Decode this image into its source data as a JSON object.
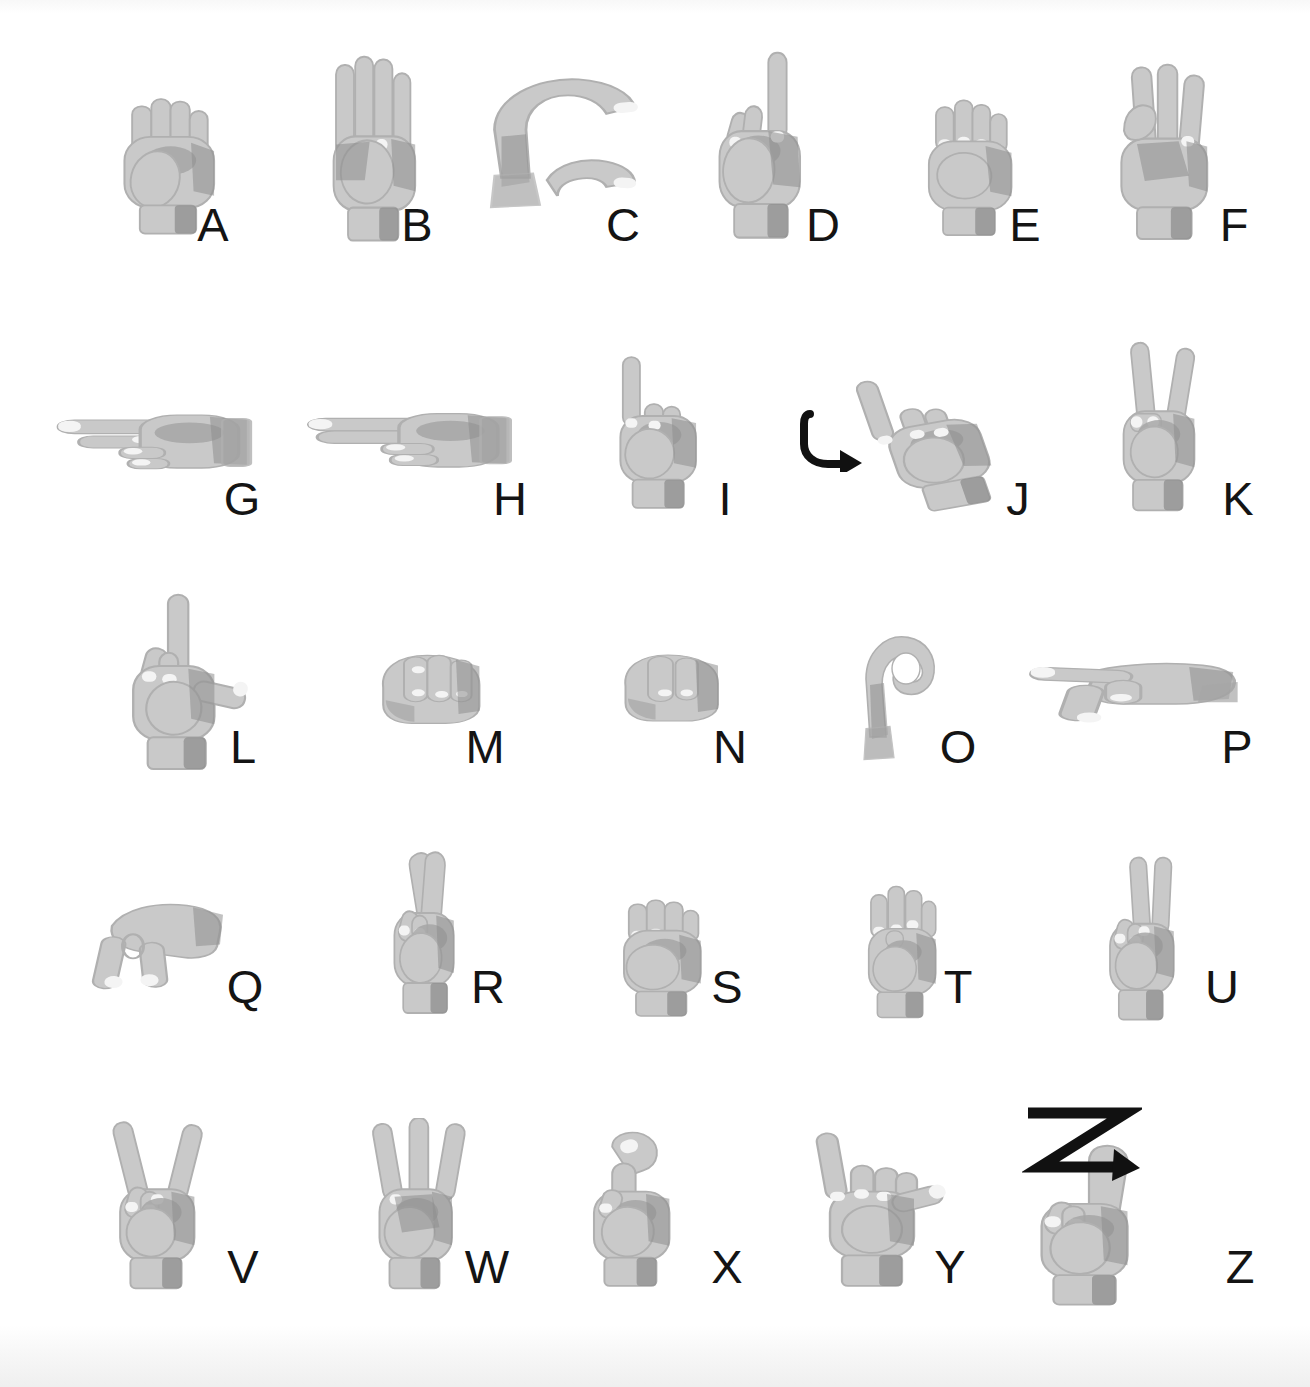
{
  "chart": {
    "width": 1310,
    "height": 1387,
    "background_color": "#ffffff",
    "letter_color": "#141414",
    "hand_fill": "#c9c9c9",
    "hand_shade": "#a6a6a6",
    "hand_deep_shade": "#8e8e8e",
    "hand_outline": "#b0b0b0",
    "nail_color": "#f4f4f4",
    "arrow_color": "#111111",
    "letter_font_size": 47,
    "rows": 5,
    "total_signs": 26
  },
  "signs": [
    {
      "letter": "A",
      "shape": "closed-fist-thumb-side",
      "row": 1,
      "col": 1,
      "hand_x": 104,
      "hand_y": 78,
      "hand_w": 128,
      "hand_h": 165,
      "letter_x": 213,
      "letter_y": 248,
      "motion": "none"
    },
    {
      "letter": "B",
      "shape": "flat-hand-thumb-across-palm",
      "row": 1,
      "col": 2,
      "hand_x": 312,
      "hand_y": 54,
      "hand_w": 120,
      "hand_h": 192,
      "letter_x": 417,
      "letter_y": 248,
      "motion": "none"
    },
    {
      "letter": "C",
      "shape": "curved-c-shape",
      "row": 1,
      "col": 3,
      "hand_x": 470,
      "hand_y": 68,
      "hand_w": 175,
      "hand_h": 160,
      "letter_x": 623,
      "letter_y": 248,
      "motion": "none"
    },
    {
      "letter": "D",
      "shape": "index-up-others-touch-thumb",
      "row": 1,
      "col": 4,
      "hand_x": 700,
      "hand_y": 50,
      "hand_w": 122,
      "hand_h": 196,
      "letter_x": 823,
      "letter_y": 248,
      "motion": "none"
    },
    {
      "letter": "E",
      "shape": "fingers-curled-onto-thumb",
      "row": 1,
      "col": 5,
      "hand_x": 910,
      "hand_y": 82,
      "hand_w": 118,
      "hand_h": 160,
      "letter_x": 1025,
      "letter_y": 248,
      "motion": "none"
    },
    {
      "letter": "F",
      "shape": "index-thumb-circle-three-up",
      "row": 1,
      "col": 6,
      "hand_x": 1098,
      "hand_y": 62,
      "hand_w": 130,
      "hand_h": 185,
      "letter_x": 1234,
      "letter_y": 248,
      "motion": "none"
    },
    {
      "letter": "G",
      "shape": "index-thumb-pointing-sideways",
      "row": 2,
      "col": 1,
      "hand_x": 50,
      "hand_y": 388,
      "hand_w": 205,
      "hand_h": 112,
      "letter_x": 242,
      "letter_y": 522,
      "motion": "none"
    },
    {
      "letter": "H",
      "shape": "two-fingers-pointing-sideways",
      "row": 2,
      "col": 2,
      "hand_x": 300,
      "hand_y": 390,
      "hand_w": 215,
      "hand_h": 110,
      "letter_x": 510,
      "letter_y": 522,
      "motion": "none"
    },
    {
      "letter": "I",
      "shape": "pinky-up-fist",
      "row": 2,
      "col": 3,
      "hand_x": 596,
      "hand_y": 350,
      "hand_w": 122,
      "hand_h": 165,
      "letter_x": 725,
      "letter_y": 522,
      "motion": "none"
    },
    {
      "letter": "J",
      "shape": "pinky-up-with-j-trace",
      "row": 2,
      "col": 4,
      "hand_x": 856,
      "hand_y": 368,
      "hand_w": 150,
      "hand_h": 150,
      "letter_x": 1018,
      "letter_y": 522,
      "motion": "hook-arrow",
      "arrow_x": 800,
      "arrow_y": 410,
      "arrow_w": 70,
      "arrow_h": 62
    },
    {
      "letter": "K",
      "shape": "index-middle-up-thumb-between",
      "row": 2,
      "col": 5,
      "hand_x": 1100,
      "hand_y": 340,
      "hand_w": 118,
      "hand_h": 178,
      "letter_x": 1238,
      "letter_y": 522,
      "motion": "none"
    },
    {
      "letter": "L",
      "shape": "index-up-thumb-out-l-shape",
      "row": 3,
      "col": 1,
      "hand_x": 110,
      "hand_y": 592,
      "hand_w": 145,
      "hand_h": 185,
      "letter_x": 243,
      "letter_y": 770,
      "motion": "none"
    },
    {
      "letter": "M",
      "shape": "thumb-under-three-fingers",
      "row": 3,
      "col": 2,
      "hand_x": 365,
      "hand_y": 640,
      "hand_w": 130,
      "hand_h": 108,
      "letter_x": 485,
      "letter_y": 770,
      "motion": "none"
    },
    {
      "letter": "N",
      "shape": "thumb-under-two-fingers",
      "row": 3,
      "col": 3,
      "hand_x": 608,
      "hand_y": 640,
      "hand_w": 125,
      "hand_h": 105,
      "letter_x": 730,
      "letter_y": 770,
      "motion": "none"
    },
    {
      "letter": "O",
      "shape": "fingers-thumb-circle",
      "row": 3,
      "col": 4,
      "hand_x": 848,
      "hand_y": 625,
      "hand_w": 100,
      "hand_h": 145,
      "letter_x": 958,
      "letter_y": 770,
      "motion": "none"
    },
    {
      "letter": "P",
      "shape": "k-shape-pointing-down",
      "row": 3,
      "col": 5,
      "hand_x": 1022,
      "hand_y": 645,
      "hand_w": 220,
      "hand_h": 118,
      "letter_x": 1237,
      "letter_y": 770,
      "motion": "none"
    },
    {
      "letter": "Q",
      "shape": "g-shape-pointing-down",
      "row": 4,
      "col": 1,
      "hand_x": 88,
      "hand_y": 885,
      "hand_w": 150,
      "hand_h": 130,
      "letter_x": 245,
      "letter_y": 1010,
      "motion": "none"
    },
    {
      "letter": "R",
      "shape": "crossed-index-middle",
      "row": 4,
      "col": 2,
      "hand_x": 368,
      "hand_y": 848,
      "hand_w": 110,
      "hand_h": 175,
      "letter_x": 488,
      "letter_y": 1010,
      "motion": "none"
    },
    {
      "letter": "S",
      "shape": "fist-thumb-across-front",
      "row": 4,
      "col": 3,
      "hand_x": 600,
      "hand_y": 882,
      "hand_w": 120,
      "hand_h": 142,
      "letter_x": 727,
      "letter_y": 1010,
      "motion": "none"
    },
    {
      "letter": "T",
      "shape": "thumb-between-index-middle",
      "row": 4,
      "col": 4,
      "hand_x": 845,
      "hand_y": 878,
      "hand_w": 108,
      "hand_h": 148,
      "letter_x": 958,
      "letter_y": 1010,
      "motion": "none"
    },
    {
      "letter": "U",
      "shape": "index-middle-together-up",
      "row": 4,
      "col": 5,
      "hand_x": 1088,
      "hand_y": 855,
      "hand_w": 110,
      "hand_h": 172,
      "letter_x": 1222,
      "letter_y": 1010,
      "motion": "none"
    },
    {
      "letter": "V",
      "shape": "index-middle-spread-up",
      "row": 5,
      "col": 1,
      "hand_x": 92,
      "hand_y": 1118,
      "hand_w": 128,
      "hand_h": 178,
      "letter_x": 243,
      "letter_y": 1290,
      "motion": "none"
    },
    {
      "letter": "W",
      "shape": "three-fingers-up",
      "row": 5,
      "col": 2,
      "hand_x": 352,
      "hand_y": 1118,
      "hand_w": 125,
      "hand_h": 178,
      "letter_x": 487,
      "letter_y": 1290,
      "motion": "none"
    },
    {
      "letter": "X",
      "shape": "index-hooked",
      "row": 5,
      "col": 3,
      "hand_x": 568,
      "hand_y": 1128,
      "hand_w": 130,
      "hand_h": 165,
      "letter_x": 727,
      "letter_y": 1290,
      "motion": "none"
    },
    {
      "letter": "Y",
      "shape": "thumb-pinky-extended",
      "row": 5,
      "col": 4,
      "hand_x": 800,
      "hand_y": 1128,
      "hand_w": 150,
      "hand_h": 165,
      "letter_x": 950,
      "letter_y": 1290,
      "motion": "none"
    },
    {
      "letter": "Z",
      "shape": "index-up-with-z-trace",
      "row": 5,
      "col": 5,
      "hand_x": 1015,
      "hand_y": 1140,
      "hand_w": 148,
      "hand_h": 172,
      "letter_x": 1240,
      "letter_y": 1290,
      "motion": "zigzag-arrow",
      "arrow_x": 1022,
      "arrow_y": 1105,
      "arrow_w": 120,
      "arrow_h": 78
    }
  ]
}
